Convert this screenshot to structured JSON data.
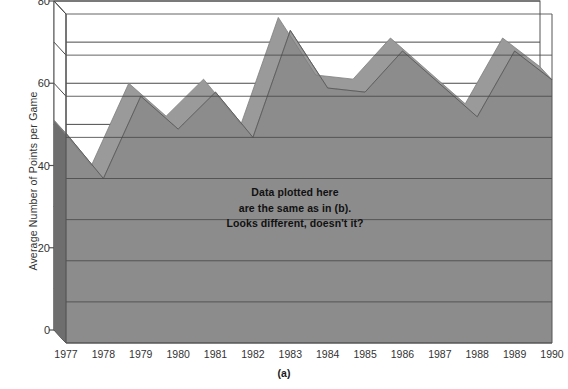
{
  "chart_data": {
    "type": "area",
    "title": "",
    "subtitle": "",
    "xlabel": "",
    "ylabel": "Average Number of Points per Game",
    "caption": "(a)",
    "categories": [
      1977,
      1978,
      1979,
      1980,
      1981,
      1982,
      1983,
      1984,
      1985,
      1986,
      1987,
      1988,
      1989,
      1990
    ],
    "xticklabels": [
      "1977",
      "1978",
      "1979",
      "1980",
      "1981",
      "1982",
      "1983",
      "1984",
      "1985",
      "1986",
      "1987",
      "1988",
      "1989",
      "1990"
    ],
    "values": [
      51,
      40,
      60,
      52,
      61,
      50,
      76,
      62,
      61,
      71,
      63,
      55,
      71,
      64
    ],
    "series": [
      {
        "name": "Average Number of Points per Game",
        "values": [
          51,
          40,
          60,
          52,
          61,
          50,
          76,
          62,
          61,
          71,
          63,
          55,
          71,
          64
        ]
      }
    ],
    "ylim": [
      0,
      80
    ],
    "yticks": [
      0,
      20,
      40,
      60,
      80
    ],
    "yticklabels": [
      "0",
      "20",
      "40",
      "60",
      "80"
    ],
    "gridlines_y": [
      0,
      10,
      20,
      30,
      40,
      50,
      60,
      70,
      80
    ],
    "grid": true,
    "legend": "none",
    "style": "3d-area",
    "annotation_lines": [
      "Data plotted here",
      "are the same as in (b).",
      "Looks different, doesn't it?"
    ],
    "colors": {
      "area_fill": "#8c8c8c",
      "area_side": "#6e6e6e",
      "area_top_edge": "#9a9a9a",
      "gridline": "#4a4a4a",
      "axis": "#555555",
      "text": "#333333",
      "annotation_text": "#111111",
      "background": "#ffffff"
    }
  }
}
